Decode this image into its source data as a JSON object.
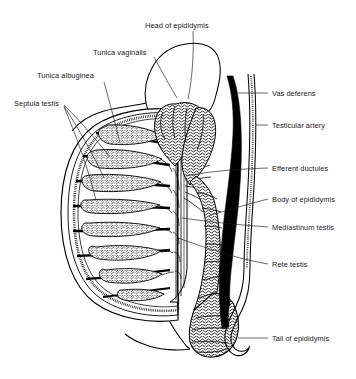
{
  "figure": {
    "style": "black-and-white line drawing",
    "background_color": "#ffffff",
    "line_color": "#000000",
    "text_color": "#1a1a1a"
  },
  "labels": {
    "head_of_epididymis": "Head of epididymis",
    "tunica_vaginalis": "Tunica vaginalis",
    "tunica_albuginea": "Tunica albuginea",
    "septula_testis": "Septula testis",
    "vas_deferens": "Vas deferens",
    "testicular_artery": "Testicular artery",
    "efferent_ductules": "Efferent ductules",
    "body_of_epididymis": "Body of epididymis",
    "mediastinum_testis": "Mediastinum testis",
    "rete_testis": "Rete testis",
    "tail_of_epididymis": "Tail of epididymis"
  }
}
